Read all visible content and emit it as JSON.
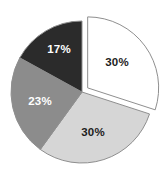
{
  "chart_data": {
    "type": "pie",
    "title": "",
    "subtitle": "",
    "xlabel": "",
    "ylabel": "",
    "grid": false,
    "legend_position": "none",
    "labels_shown_as": "percent",
    "background_color": "#ffffff",
    "outline_color": "#8f8f8f",
    "center": {
      "x": 82,
      "y": 92
    },
    "radius": 71,
    "start_angle_deg": 0,
    "direction": "clockwise",
    "categories": [
      "Slice 1",
      "Slice 2",
      "Slice 3",
      "Slice 4"
    ],
    "values": [
      30,
      30,
      23,
      17
    ],
    "slices": [
      {
        "label": "30%",
        "value": 30,
        "color": "#ffffff",
        "text_color": "#1d1d1d",
        "exploded": true,
        "position": "top-right",
        "start_angle_deg": 0,
        "end_angle_deg": 108,
        "label_x": 117,
        "label_y": 63
      },
      {
        "label": "30%",
        "value": 30,
        "color": "#d6d6d6",
        "text_color": "#1d1d1d",
        "exploded": false,
        "position": "bottom",
        "start_angle_deg": 108,
        "end_angle_deg": 216,
        "label_x": 93,
        "label_y": 133
      },
      {
        "label": "23%",
        "value": 23,
        "color": "#8c8c8c",
        "text_color": "#ffffff",
        "exploded": false,
        "position": "left",
        "start_angle_deg": 216,
        "end_angle_deg": 298.8,
        "label_x": 40,
        "label_y": 102
      },
      {
        "label": "17%",
        "value": 17,
        "color": "#2b2b2b",
        "text_color": "#ffffff",
        "exploded": false,
        "position": "top-left",
        "start_angle_deg": 298.8,
        "end_angle_deg": 360,
        "label_x": 59,
        "label_y": 50
      }
    ]
  }
}
